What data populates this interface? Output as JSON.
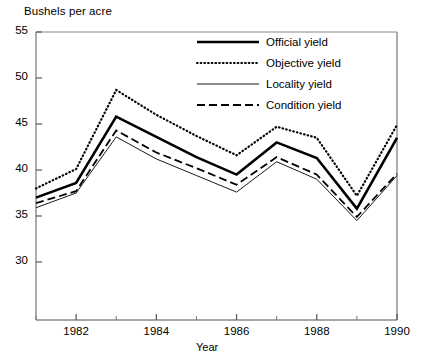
{
  "chart_data": {
    "type": "line",
    "title": "",
    "ylabel": "Bushels per acre",
    "xlabel": "Year",
    "grid": false,
    "legend_position": "top-right-inside",
    "ylim": [
      28,
      55
    ],
    "xlim": [
      1981,
      1990
    ],
    "y_ticks": [
      30,
      35,
      40,
      45,
      50,
      55
    ],
    "y_tick_labels": [
      "30",
      "35",
      "40",
      "45",
      "50",
      "55"
    ],
    "x_ticks": [
      1982,
      1984,
      1986,
      1988,
      1990
    ],
    "x_tick_labels": [
      "1982",
      "1984",
      "1986",
      "1988",
      "1990"
    ],
    "x_minor_ticks": [
      1981,
      1983,
      1985,
      1987,
      1989
    ],
    "x": [
      1981,
      1982,
      1983,
      1984,
      1985,
      1986,
      1987,
      1988,
      1989,
      1990
    ],
    "series": [
      {
        "name": "Official yield",
        "style": "thick-solid",
        "color": "#000000",
        "values": [
          37.0,
          38.6,
          45.8,
          43.6,
          41.4,
          39.5,
          43.0,
          41.3,
          35.8,
          43.5
        ]
      },
      {
        "name": "Objective yield",
        "style": "dotted",
        "color": "#000000",
        "values": [
          38.0,
          40.1,
          48.7,
          46.0,
          43.7,
          41.6,
          44.7,
          43.5,
          37.2,
          44.9
        ]
      },
      {
        "name": "Locality yield",
        "style": "thin-solid",
        "color": "#000000",
        "values": [
          35.9,
          37.5,
          43.6,
          41.2,
          39.4,
          37.6,
          40.9,
          39.0,
          34.5,
          39.4
        ]
      },
      {
        "name": "Condition yield",
        "style": "dashed",
        "color": "#000000",
        "values": [
          36.4,
          37.7,
          44.3,
          41.9,
          40.2,
          38.4,
          41.4,
          39.5,
          34.9,
          39.6
        ]
      }
    ]
  },
  "legend": {
    "items": [
      {
        "label": "Official yield"
      },
      {
        "label": "Objective yield"
      },
      {
        "label": "Locality yield"
      },
      {
        "label": "Condition yield"
      }
    ]
  }
}
